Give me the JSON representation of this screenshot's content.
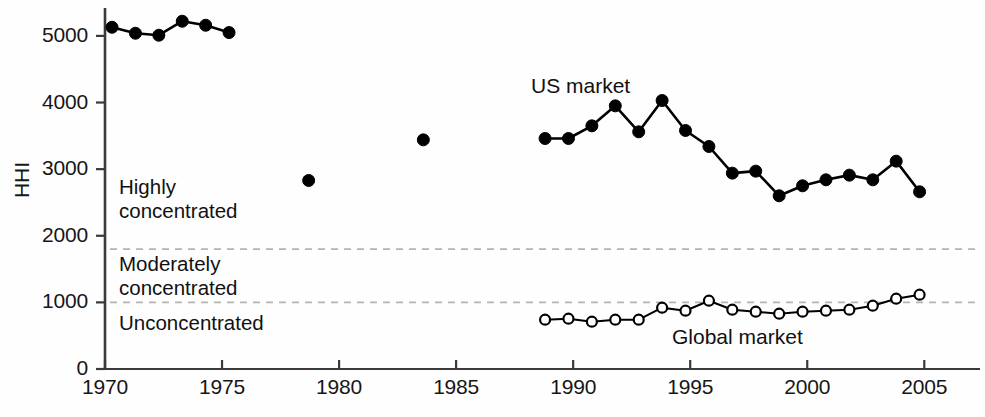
{
  "chart_data": {
    "type": "line",
    "title": "",
    "xlabel": "",
    "ylabel": "HHI",
    "xlim": [
      1970,
      2005.8
    ],
    "ylim": [
      0,
      5400
    ],
    "grid": false,
    "legend_position": "inline-annotation",
    "x_ticks": [
      1970,
      1975,
      1980,
      1985,
      1990,
      1995,
      2000,
      2005
    ],
    "y_ticks": [
      0,
      1000,
      2000,
      3000,
      4000,
      5000
    ],
    "threshold_lines": [
      {
        "value": 1800,
        "style": "dashed",
        "color": "#b4b4b4"
      },
      {
        "value": 1000,
        "style": "dashed",
        "color": "#b4b4b4"
      }
    ],
    "zone_annotations": [
      {
        "label_line1": "Highly",
        "label_line2": "concentrated",
        "range": [
          1800,
          5400
        ]
      },
      {
        "label_line1": "Moderately",
        "label_line2": "concentrated",
        "range": [
          1000,
          1800
        ]
      },
      {
        "label_line1": "Unconcentrated",
        "label_line2": "",
        "range": [
          0,
          1000
        ]
      }
    ],
    "series": [
      {
        "name": "US market",
        "marker": "filled-circle",
        "color": "#000000",
        "segments": [
          {
            "connected": true,
            "x": [
              1970.3,
              1971.3,
              1972.3,
              1973.3,
              1974.3,
              1975.3
            ],
            "y": [
              5130,
              5040,
              5010,
              5220,
              5160,
              5050
            ]
          },
          {
            "connected": false,
            "x": [
              1978.7
            ],
            "y": [
              2830
            ]
          },
          {
            "connected": false,
            "x": [
              1983.6
            ],
            "y": [
              3440
            ]
          },
          {
            "connected": true,
            "x": [
              1988.8,
              1989.8,
              1990.8,
              1991.8,
              1992.8,
              1993.8,
              1994.8,
              1995.8,
              1996.8,
              1997.8,
              1998.8,
              1999.8,
              2000.8,
              2001.8,
              2002.8,
              2003.8,
              2004.8
            ],
            "y": [
              3460,
              3460,
              3650,
              3950,
              3560,
              4030,
              3580,
              3340,
              2940,
              2970,
              2600,
              2750,
              2840,
              2910,
              2840,
              3120,
              2660
            ]
          }
        ]
      },
      {
        "name": "Global market",
        "marker": "open-circle",
        "color": "#000000",
        "segments": [
          {
            "connected": true,
            "x": [
              1988.8,
              1989.8,
              1990.8,
              1991.8,
              1992.8,
              1993.8,
              1994.8,
              1995.8,
              1996.8,
              1997.8,
              1998.8,
              1999.8,
              2000.8,
              2001.8,
              2002.8,
              2003.8,
              2004.8
            ],
            "y": [
              740,
              755,
              710,
              740,
              740,
              920,
              875,
              1025,
              890,
              860,
              830,
              860,
              875,
              890,
              950,
              1055,
              1115
            ]
          }
        ]
      }
    ]
  },
  "labels": {
    "y_axis_title": "HHI",
    "us_series_label": "US market",
    "global_series_label": "Global market",
    "zone_high_1": "Highly",
    "zone_high_2": "concentrated",
    "zone_mod_1": "Moderately",
    "zone_mod_2": "concentrated",
    "zone_uncon_1": "Unconcentrated"
  }
}
